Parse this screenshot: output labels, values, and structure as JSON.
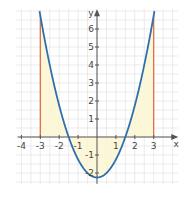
{
  "chart_data": {
    "type": "line",
    "title": "",
    "xlabel": "x",
    "ylabel": "y",
    "xlim": [
      -4.3,
      4.3
    ],
    "ylim": [
      -2.6,
      7.1
    ],
    "grid": true,
    "x_ticks": [
      -4,
      -3,
      -2,
      -1,
      1,
      2,
      3
    ],
    "y_ticks": [
      -2,
      -1,
      1,
      2,
      3,
      4,
      5,
      6
    ],
    "series": [
      {
        "name": "f(x) = x^2 - 2.25",
        "function": "x^2 - 2.25",
        "domain": [
          -3.1,
          3.1
        ],
        "color": "#2f6fad"
      }
    ],
    "shaded_region": {
      "between": "curve and x-axis",
      "x_from": -3,
      "x_to": 3,
      "color": "#fdf6d2"
    },
    "vertical_lines": [
      {
        "x": -3,
        "color": "#e0643c"
      },
      {
        "x": 3,
        "color": "#e0643c"
      }
    ]
  }
}
